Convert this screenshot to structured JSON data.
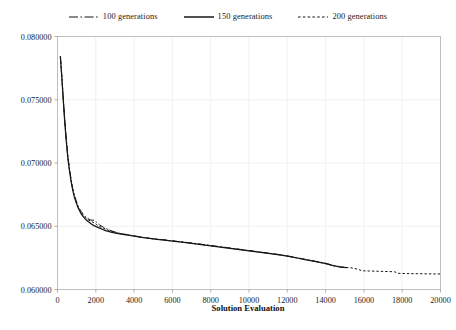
{
  "chart_data": {
    "type": "line",
    "title": "",
    "xlabel": "Solution Evaluation",
    "ylabel": "",
    "xlim": [
      0,
      20000
    ],
    "ylim": [
      0.06,
      0.08
    ],
    "grid": true,
    "legend_position": "top-center",
    "xticks": [
      0,
      2000,
      4000,
      6000,
      8000,
      10000,
      12000,
      14000,
      16000,
      18000,
      20000
    ],
    "xtick_labels": [
      "0",
      "2000",
      "4000",
      "6000",
      "8000",
      "10000",
      "12000",
      "14000",
      "16000",
      "18000",
      "20000"
    ],
    "yticks": [
      0.06,
      0.065,
      0.07,
      0.075,
      0.08
    ],
    "ytick_labels": [
      "0.060000",
      "0.065000",
      "0.070000",
      "0.075000",
      "0.080000"
    ],
    "series": [
      {
        "name": "100 generations",
        "style": "dash-dot",
        "color": "#171717",
        "points": [
          [
            150,
            0.0784
          ],
          [
            220,
            0.077
          ],
          [
            300,
            0.0752
          ],
          [
            380,
            0.0734
          ],
          [
            460,
            0.0719
          ],
          [
            540,
            0.0706
          ],
          [
            620,
            0.0696
          ],
          [
            700,
            0.0688
          ],
          [
            790,
            0.068
          ],
          [
            880,
            0.06745
          ],
          [
            980,
            0.067
          ],
          [
            1080,
            0.0666
          ],
          [
            1200,
            0.06625
          ],
          [
            1320,
            0.066
          ],
          [
            1450,
            0.06578
          ],
          [
            1600,
            0.0656
          ],
          [
            1750,
            0.06548
          ],
          [
            1900,
            0.06548
          ],
          [
            2050,
            0.0653
          ],
          [
            2200,
            0.0651
          ],
          [
            2400,
            0.06492
          ],
          [
            2600,
            0.06478
          ],
          [
            2850,
            0.06462
          ],
          [
            3100,
            0.0645
          ],
          [
            3400,
            0.0644
          ],
          [
            3700,
            0.06432
          ],
          [
            4000,
            0.06424
          ],
          [
            4400,
            0.06414
          ],
          [
            4800,
            0.06405
          ],
          [
            5200,
            0.06398
          ],
          [
            5600,
            0.06392
          ],
          [
            6000,
            0.06385
          ],
          [
            6500,
            0.06376
          ],
          [
            7000,
            0.06368
          ],
          [
            7500,
            0.06358
          ],
          [
            8000,
            0.06348
          ],
          [
            8500,
            0.06338
          ],
          [
            9000,
            0.06328
          ],
          [
            9500,
            0.06318
          ],
          [
            10000,
            0.06308
          ],
          [
            10500,
            0.06298
          ],
          [
            11000,
            0.06288
          ],
          [
            11500,
            0.06278
          ],
          [
            12000,
            0.06266
          ],
          [
            12500,
            0.06252
          ],
          [
            13000,
            0.06236
          ],
          [
            13500,
            0.06222
          ],
          [
            14000,
            0.06208
          ],
          [
            14400,
            0.0619
          ],
          [
            14800,
            0.06178
          ],
          [
            15100,
            0.06174
          ]
        ]
      },
      {
        "name": "150 generations",
        "style": "solid",
        "color": "#171717",
        "points": [
          [
            150,
            0.07845
          ],
          [
            220,
            0.0769
          ],
          [
            300,
            0.075
          ],
          [
            380,
            0.0732
          ],
          [
            460,
            0.0717
          ],
          [
            540,
            0.0704
          ],
          [
            620,
            0.06945
          ],
          [
            700,
            0.06865
          ],
          [
            790,
            0.0679
          ],
          [
            880,
            0.0673
          ],
          [
            980,
            0.06685
          ],
          [
            1080,
            0.06645
          ],
          [
            1200,
            0.06608
          ],
          [
            1320,
            0.0658
          ],
          [
            1450,
            0.06558
          ],
          [
            1600,
            0.06538
          ],
          [
            1750,
            0.0652
          ],
          [
            1900,
            0.06505
          ],
          [
            2050,
            0.06495
          ],
          [
            2200,
            0.06485
          ],
          [
            2400,
            0.06472
          ],
          [
            2600,
            0.06462
          ],
          [
            2850,
            0.06452
          ],
          [
            3100,
            0.06444
          ],
          [
            3400,
            0.06436
          ],
          [
            3700,
            0.06429
          ],
          [
            4000,
            0.06422
          ],
          [
            4400,
            0.06412
          ],
          [
            4800,
            0.06404
          ],
          [
            5200,
            0.06397
          ],
          [
            5600,
            0.0639
          ],
          [
            6000,
            0.06383
          ],
          [
            6500,
            0.06374
          ],
          [
            7000,
            0.06365
          ],
          [
            7500,
            0.06355
          ],
          [
            8000,
            0.06345
          ],
          [
            8500,
            0.06335
          ],
          [
            9000,
            0.06325
          ],
          [
            9500,
            0.06315
          ],
          [
            10000,
            0.06305
          ],
          [
            10500,
            0.06296
          ],
          [
            11000,
            0.06286
          ],
          [
            11500,
            0.06275
          ],
          [
            12000,
            0.06263
          ],
          [
            12500,
            0.06249
          ],
          [
            13000,
            0.06234
          ],
          [
            13500,
            0.0622
          ],
          [
            14000,
            0.06205
          ],
          [
            14400,
            0.06188
          ],
          [
            14800,
            0.06176
          ],
          [
            15100,
            0.06173
          ]
        ]
      },
      {
        "name": "200 generations",
        "style": "dotted",
        "color": "#171717",
        "points": [
          [
            150,
            0.07835
          ],
          [
            220,
            0.07695
          ],
          [
            300,
            0.0751
          ],
          [
            380,
            0.0733
          ],
          [
            460,
            0.0718
          ],
          [
            540,
            0.0705
          ],
          [
            620,
            0.06955
          ],
          [
            700,
            0.06872
          ],
          [
            790,
            0.06795
          ],
          [
            880,
            0.06738
          ],
          [
            980,
            0.06692
          ],
          [
            1080,
            0.06652
          ],
          [
            1200,
            0.06618
          ],
          [
            1320,
            0.06592
          ],
          [
            1450,
            0.0657
          ],
          [
            1600,
            0.06552
          ],
          [
            1750,
            0.06538
          ],
          [
            1900,
            0.06528
          ],
          [
            2050,
            0.06512
          ],
          [
            2200,
            0.06498
          ],
          [
            2400,
            0.06484
          ],
          [
            2600,
            0.06472
          ],
          [
            2850,
            0.06458
          ],
          [
            3100,
            0.06448
          ],
          [
            3400,
            0.06438
          ],
          [
            3700,
            0.0643
          ],
          [
            4000,
            0.06423
          ],
          [
            4400,
            0.06413
          ],
          [
            4800,
            0.06404
          ],
          [
            5200,
            0.06397
          ],
          [
            5600,
            0.06391
          ],
          [
            6000,
            0.06384
          ],
          [
            6500,
            0.06375
          ],
          [
            7000,
            0.06366
          ],
          [
            7500,
            0.06357
          ],
          [
            8000,
            0.06347
          ],
          [
            8500,
            0.06337
          ],
          [
            9000,
            0.06327
          ],
          [
            9500,
            0.06317
          ],
          [
            10000,
            0.06307
          ],
          [
            10500,
            0.06297
          ],
          [
            11000,
            0.06287
          ],
          [
            11500,
            0.06276
          ],
          [
            12000,
            0.06264
          ],
          [
            12500,
            0.0625
          ],
          [
            13000,
            0.06235
          ],
          [
            13500,
            0.06221
          ],
          [
            14000,
            0.06206
          ],
          [
            14400,
            0.06189
          ],
          [
            14900,
            0.06175
          ],
          [
            15300,
            0.06172
          ],
          [
            15700,
            0.0616
          ],
          [
            15900,
            0.06148
          ],
          [
            16300,
            0.06146
          ],
          [
            16800,
            0.06144
          ],
          [
            17300,
            0.06142
          ],
          [
            17600,
            0.0614
          ],
          [
            17800,
            0.06128
          ],
          [
            18200,
            0.06126
          ],
          [
            18700,
            0.06125
          ],
          [
            19200,
            0.06124
          ],
          [
            19600,
            0.06123
          ],
          [
            20000,
            0.06123
          ]
        ]
      }
    ]
  },
  "legend": {
    "items": [
      {
        "label": "100 generations",
        "style": "dash-dot"
      },
      {
        "label": "150 generations",
        "style": "solid"
      },
      {
        "label": "200 generations",
        "style": "dotted"
      }
    ]
  },
  "colors": {
    "line": "#171717",
    "grid": "#ededed",
    "frame": "#b9b9b9",
    "background": "#ffffff"
  }
}
